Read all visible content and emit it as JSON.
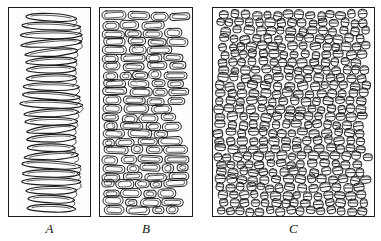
{
  "figure": {
    "kind": "scientific-line-illustration",
    "background_color": "#ffffff",
    "ink_color": "#1c1c1c",
    "panel_fill_color": "#fdfdfc",
    "panel_count": 3,
    "caption_style": "italic-serif"
  },
  "panels": [
    {
      "id": "a",
      "label": "A",
      "pattern_name": "open-helical-coil",
      "description": "A single continuous thread wound into a loose vertical helix of elongated horizontal loops",
      "turns": 23,
      "loop_width_px": 60,
      "loop_height_px": 9,
      "orientation": "horizontal-loops-stacked-vertically",
      "fill": "hollow",
      "frame": {
        "x": 8,
        "y": 7,
        "width": 83,
        "height": 210
      }
    },
    {
      "id": "b",
      "label": "B",
      "pattern_name": "compressed-capsule-coils",
      "description": "Coils contracted into short horizontal capsules packed in irregular rows",
      "rows": 24,
      "columns": 5,
      "element_shape": "capsule",
      "element_width_px": 19,
      "element_height_px": 8,
      "fill": "hollow-double-outline",
      "frame": {
        "x": 99,
        "y": 7,
        "width": 94,
        "height": 210
      }
    },
    {
      "id": "c",
      "label": "C",
      "pattern_name": "supercoiled-cross-sections",
      "description": "Fully contracted coils seen nearly end-on as small barrel shapes with a median band",
      "rows": 26,
      "columns": 15,
      "element_shape": "barrel-with-median-line",
      "element_width_px": 9,
      "element_height_px": 8,
      "fill": "hollow-with-equator-line",
      "frame": {
        "x": 212,
        "y": 7,
        "width": 163,
        "height": 210
      }
    }
  ],
  "labels": {
    "a": "A",
    "b": "B",
    "c": "C"
  }
}
